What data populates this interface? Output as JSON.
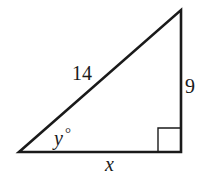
{
  "diagram": {
    "type": "right-triangle",
    "vertices": {
      "left": [
        19,
        152
      ],
      "top": [
        181,
        10
      ],
      "right_angle": [
        181,
        152
      ]
    },
    "right_angle_marker": {
      "size": 23
    },
    "labels": {
      "hypotenuse": "14",
      "vertical_leg": "9",
      "horizontal_leg": "x",
      "angle_var": "y",
      "angle_symbol": "°"
    },
    "stroke_color": "#1a1a1a"
  }
}
